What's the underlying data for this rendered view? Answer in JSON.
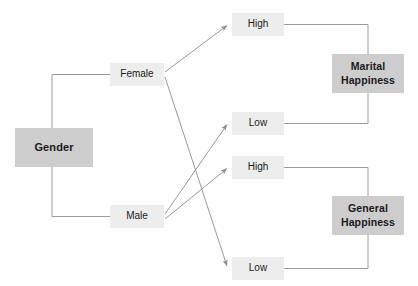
{
  "diagram": {
    "colors": {
      "background": "#ffffff",
      "node_dark_fill": "#cdcdcd",
      "node_light_fill": "#ededed",
      "connector": "#9a9a9a",
      "text": "#1a1a1a"
    },
    "nodes": {
      "gender": {
        "label": "Gender",
        "x": 15,
        "y": 128,
        "w": 78,
        "h": 39,
        "style": "root"
      },
      "female": {
        "label": "Female",
        "x": 110,
        "y": 63,
        "w": 54,
        "h": 23,
        "style": "branch"
      },
      "male": {
        "label": "Male",
        "x": 110,
        "y": 205,
        "w": 54,
        "h": 23,
        "style": "branch"
      },
      "marital_high": {
        "label": "High",
        "x": 232,
        "y": 13,
        "w": 52,
        "h": 23,
        "style": "leaf"
      },
      "marital_low": {
        "label": "Low",
        "x": 232,
        "y": 112,
        "w": 52,
        "h": 23,
        "style": "leaf"
      },
      "general_high": {
        "label": "High",
        "x": 232,
        "y": 156,
        "w": 52,
        "h": 23,
        "style": "leaf"
      },
      "general_low": {
        "label": "Low",
        "x": 232,
        "y": 257,
        "w": 52,
        "h": 23,
        "style": "leaf"
      },
      "marital_happiness": {
        "label": "Marital\nHappiness",
        "x": 332,
        "y": 54,
        "w": 72,
        "h": 39,
        "style": "outcome"
      },
      "general_happiness": {
        "label": "General\nHappiness",
        "x": 332,
        "y": 196,
        "w": 72,
        "h": 39,
        "style": "outcome"
      }
    },
    "edges": [
      {
        "name": "gender-to-female",
        "from": "gender",
        "to": "female",
        "arrow": false
      },
      {
        "name": "gender-to-male",
        "from": "gender",
        "to": "male",
        "arrow": false
      },
      {
        "name": "female-to-marital-high",
        "from": "female",
        "to": "marital_high",
        "arrow": true
      },
      {
        "name": "female-to-general-low",
        "from": "female",
        "to": "general_low",
        "arrow": true
      },
      {
        "name": "male-to-marital-low",
        "from": "male",
        "to": "marital_low",
        "arrow": true
      },
      {
        "name": "male-to-general-high",
        "from": "male",
        "to": "general_high",
        "arrow": true
      },
      {
        "name": "marital-high-to-marital-happiness",
        "from": "marital_high",
        "to": "marital_happiness",
        "arrow": false
      },
      {
        "name": "marital-low-to-marital-happiness",
        "from": "marital_low",
        "to": "marital_happiness",
        "arrow": false
      },
      {
        "name": "general-high-to-general-happiness",
        "from": "general_high",
        "to": "general_happiness",
        "arrow": false
      },
      {
        "name": "general-low-to-general-happiness",
        "from": "general_low",
        "to": "general_happiness",
        "arrow": false
      }
    ]
  }
}
